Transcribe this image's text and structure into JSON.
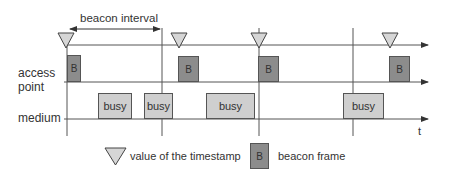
{
  "diagram": {
    "interval_label": "beacon interval",
    "rows": [
      {
        "label_line1": "access",
        "label_line2": "point"
      },
      {
        "label_line1": "medium"
      }
    ],
    "time_axis_label": "t",
    "timestamps_x": [
      66,
      179,
      259,
      390
    ],
    "beacon_frames": [
      {
        "label": "B",
        "x": 67,
        "w": 14
      },
      {
        "label": "B",
        "x": 178,
        "w": 21
      },
      {
        "label": "B",
        "x": 258,
        "w": 21
      },
      {
        "label": "B",
        "x": 389,
        "w": 21
      }
    ],
    "busy_periods": [
      {
        "label": "busy",
        "x": 98,
        "w": 34
      },
      {
        "label": "busy",
        "x": 144,
        "w": 29
      },
      {
        "label": "busy",
        "x": 206,
        "w": 49
      },
      {
        "label": "busy",
        "x": 343,
        "w": 41
      }
    ],
    "interval_markers_x": [
      162,
      353
    ]
  },
  "legend": {
    "timestamp_label": "value of the timestamp",
    "beacon_symbol": "B",
    "beacon_label": "beacon frame"
  },
  "colors": {
    "beacon_fill": "#8c8c8c",
    "busy_fill": "#cfcfcf",
    "triangle_fill": "#d6d6d6",
    "line": "#555555"
  }
}
